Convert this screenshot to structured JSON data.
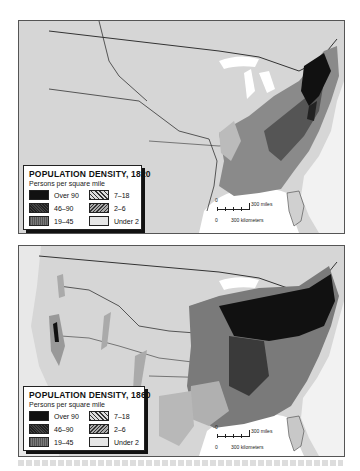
{
  "maps": [
    {
      "id": "1820",
      "legend": {
        "title": "POPULATION DENSITY, 1820",
        "subtitle": "Persons per square mile",
        "items": [
          {
            "label": "Over 90",
            "pattern": "solid-black"
          },
          {
            "label": "7–18",
            "pattern": "light-diagonal-hatch"
          },
          {
            "label": "46–90",
            "pattern": "dark-hatch"
          },
          {
            "label": "2–6",
            "pattern": "dense-crosshatch"
          },
          {
            "label": "19–45",
            "pattern": "medium-stipple"
          },
          {
            "label": "Under 2",
            "pattern": "light-stipple"
          }
        ]
      },
      "scale": {
        "miles_label": "300 miles",
        "km_label": "300 kilometers",
        "zero": "0"
      }
    },
    {
      "id": "1860",
      "legend": {
        "title": "POPULATION DENSITY, 1860",
        "subtitle": "Persons per square mile",
        "items": [
          {
            "label": "Over 90",
            "pattern": "solid-black"
          },
          {
            "label": "7–18",
            "pattern": "light-diagonal-hatch"
          },
          {
            "label": "46–90",
            "pattern": "dark-hatch"
          },
          {
            "label": "2–6",
            "pattern": "dense-crosshatch"
          },
          {
            "label": "19–45",
            "pattern": "medium-stipple"
          },
          {
            "label": "Under 2",
            "pattern": "light-stipple"
          }
        ]
      },
      "scale": {
        "miles_label": "300 miles",
        "km_label": "300 kilometers",
        "zero": "0"
      }
    }
  ],
  "colors": {
    "land": "#d9d9d9",
    "water": "#ffffff",
    "over90": "#111111",
    "border": "#555555"
  }
}
